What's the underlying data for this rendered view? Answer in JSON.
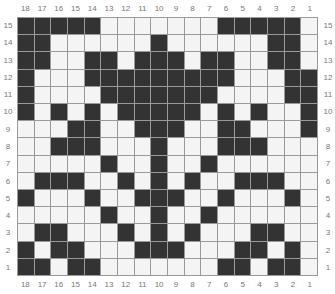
{
  "chart": {
    "columns": [
      "18",
      "17",
      "16",
      "15",
      "14",
      "13",
      "12",
      "11",
      "10",
      "9",
      "8",
      "7",
      "6",
      "5",
      "4",
      "3",
      "2",
      "1"
    ],
    "rows": [
      "15",
      "14",
      "13",
      "12",
      "11",
      "10",
      "9",
      "8",
      "7",
      "6",
      "5",
      "4",
      "3",
      "2",
      "1"
    ],
    "colors": {
      "filled": "#333333",
      "empty": "#f4f4f4",
      "gridline": "#9a9a9a"
    },
    "pattern": [
      "DDDDDLLLLLLLDDDDDL",
      "DDLLLLLLDLLLLLLDDL",
      "DDLLDDLDDDLDDLLDDL",
      "DLLLDDDDDDDDDLLLDD",
      "DLLLLDDDDDDDLLLLDD",
      "DLDLDLDDDDDLDLDLLD",
      "LLLDDLLDDDLLDDLLLD",
      "LLDDDLLLDLLLDDDLLL",
      "LLLLLDLLDLLDLLLLLL",
      "LDDDLLDLDLDLLDDDLL",
      "DLLLDLLDDDLLDLLLDL",
      "LLLLLDLLDLLDLLLLLL",
      "LDDLLLDLDLDLLLDDLL",
      "DLDDLLLDDDLLLDDLDL",
      "DDLDDLLLLLLLDDLDDL"
    ]
  }
}
